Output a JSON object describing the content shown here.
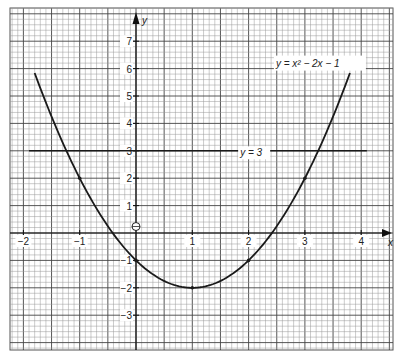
{
  "chart_data": {
    "type": "line",
    "title": "",
    "xlabel": "x",
    "ylabel": "y",
    "xlim": [
      -2.1,
      4.2
    ],
    "ylim": [
      -4.3,
      8.2
    ],
    "grid": true,
    "x_ticks": [
      -2,
      -1,
      1,
      2,
      3,
      4
    ],
    "x_tick_labels": [
      "−2",
      "−1",
      "1",
      "2",
      "3",
      "4"
    ],
    "y_ticks": [
      7,
      6,
      5,
      4,
      3,
      2,
      1,
      -1,
      -2,
      -3
    ],
    "y_tick_labels": [
      "7",
      "6",
      "5",
      "4",
      "3",
      "2",
      "1",
      "−1",
      "−2",
      "−3"
    ],
    "origin_label": "O",
    "series": [
      {
        "name": "y = x² − 2x − 1",
        "label": "y = x² − 2x − 1",
        "equation": "x^2 - 2x - 1",
        "x_range": [
          -1.8,
          3.8
        ],
        "points": [
          [
            -1.8,
            5.84
          ],
          [
            -1.5,
            4.25
          ],
          [
            -1,
            2
          ],
          [
            -0.5,
            0.25
          ],
          [
            0,
            -1
          ],
          [
            0.5,
            -1.75
          ],
          [
            1,
            -2
          ],
          [
            1.5,
            -1.75
          ],
          [
            2,
            -1
          ],
          [
            2.5,
            0.25
          ],
          [
            3,
            2
          ],
          [
            3.5,
            4.25
          ],
          [
            3.8,
            5.84
          ]
        ],
        "marked_points": [
          [
            -1,
            2
          ],
          [
            0,
            -1
          ],
          [
            1,
            -2
          ],
          [
            2,
            -1
          ],
          [
            3,
            2
          ]
        ]
      },
      {
        "name": "y = 3",
        "label": "y = 3",
        "equation": "3",
        "x_range": [
          -1.9,
          4.1
        ]
      }
    ],
    "annotations": [
      {
        "text": "y = x² − 2x − 1",
        "x": 3.0,
        "y": 6.0
      },
      {
        "text": "y = 3",
        "x": 1.85,
        "y": 2.8
      }
    ]
  }
}
